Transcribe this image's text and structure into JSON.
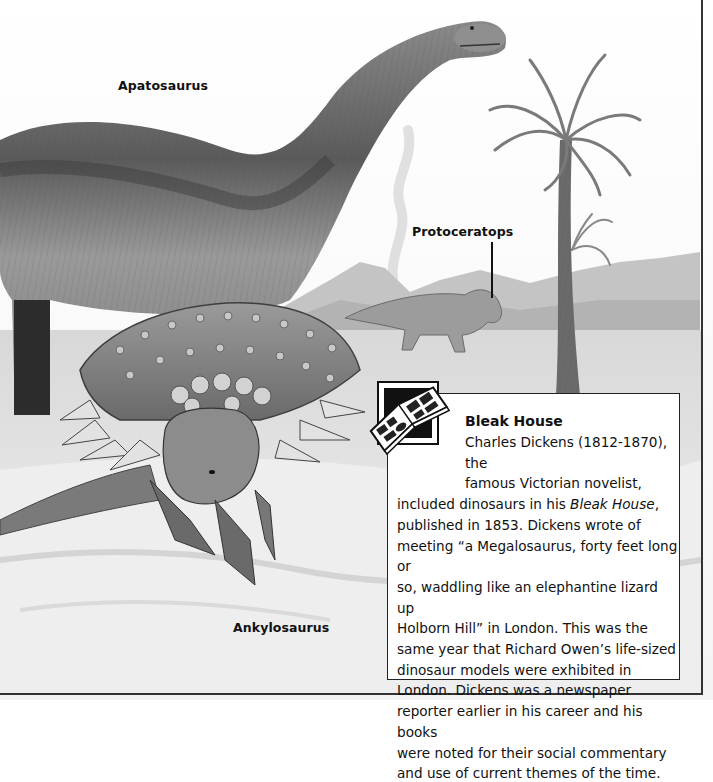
{
  "page": {
    "background": "#ffffff",
    "illustration": {
      "style": "grayscale pencil illustration",
      "elements": [
        "apatosaurus",
        "ankylosaurus",
        "protoceratops",
        "palm-tree",
        "volcano",
        "mountains",
        "plain"
      ]
    }
  },
  "labels": {
    "apatosaurus": "Apatosaurus",
    "protoceratops": "Protoceratops",
    "ankylosaurus": "Ankylosaurus"
  },
  "infobox": {
    "icon": "open-book-icon",
    "title": "Bleak House",
    "lines": [
      "Charles Dickens (1812-1870), the",
      "famous Victorian novelist,",
      "included dinosaurs in his ",
      "Bleak House",
      ",",
      "published in 1853. Dickens wrote of",
      "meeting “a Megalosaurus, forty feet long or",
      "so, waddling like an elephantine lizard up",
      "Holborn Hill” in London. This was the",
      "same year that Richard Owen’s life-sized",
      "dinosaur models were exhibited in",
      "London. Dickens was a newspaper",
      "reporter earlier in his career and his books",
      "were noted for their social commentary",
      "and use of current themes of the time."
    ]
  }
}
